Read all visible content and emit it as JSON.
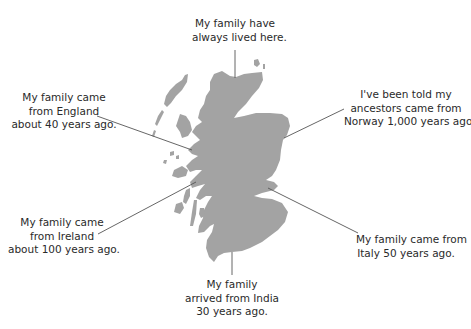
{
  "map": {
    "region": "Scotland",
    "land_color": "#a3a3a3",
    "line_color": "#555555"
  },
  "callouts": [
    {
      "id": "north",
      "lines": [
        "My family have",
        "always lived here."
      ]
    },
    {
      "id": "england",
      "lines": [
        "My family came",
        "from England",
        "about 40 years ago."
      ]
    },
    {
      "id": "norway",
      "lines": [
        "I've been told my",
        "ancestors came from",
        "Norway 1,000 years ago!"
      ]
    },
    {
      "id": "ireland",
      "lines": [
        "My family came",
        "from Ireland",
        "about 100 years ago."
      ]
    },
    {
      "id": "italy",
      "lines": [
        "My family came from",
        "Italy 50 years ago."
      ]
    },
    {
      "id": "india",
      "lines": [
        "My family",
        "arrived from India",
        "30 years ago."
      ]
    }
  ]
}
